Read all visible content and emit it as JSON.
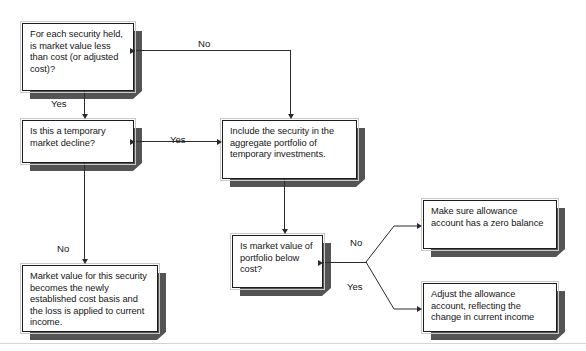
{
  "diagram": {
    "title_fragment": "",
    "nodes": [
      {
        "id": "n1",
        "name": "decision-security-market-value",
        "text": "For each security held, is market value less than cost (or adjusted cost)?"
      },
      {
        "id": "n2",
        "name": "decision-temporary-decline",
        "text": "Is this a temporary market decline?"
      },
      {
        "id": "n3",
        "name": "process-include-security",
        "text": "Include the security in the aggregate portfolio of temporary investments."
      },
      {
        "id": "n4",
        "name": "decision-portfolio-below-cost",
        "text": "Is market value of portfolio below cost?"
      },
      {
        "id": "n5",
        "name": "process-market-value-new-cost-basis",
        "text": "Market value for this security becomes the newly established cost basis and the loss is applied to current income."
      },
      {
        "id": "n6",
        "name": "process-zero-allowance-balance",
        "text": "Make sure allowance account has a zero balance"
      },
      {
        "id": "n7",
        "name": "process-adjust-allowance-account",
        "text": "Adjust the allowance account, reflecting the change in current income"
      }
    ],
    "edge_labels": {
      "n1_no": "No",
      "n1_yes": "Yes",
      "n2_yes": "Yes",
      "n2_no": "No",
      "n4_no": "No",
      "n4_yes": "Yes"
    },
    "colors": {
      "box_border": "#1d1d1d",
      "box_outer_frame": "#c9c9c9",
      "shadow": "#545454",
      "connector": "#2a2a2a",
      "background": "#ffffff",
      "text": "#161616",
      "footer_rule": "#d4d4d4"
    }
  }
}
